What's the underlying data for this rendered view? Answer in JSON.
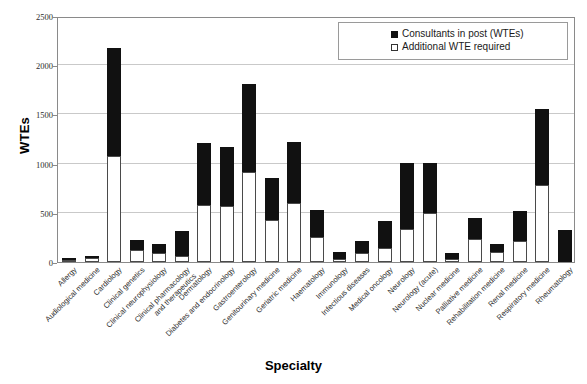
{
  "chart_data": {
    "type": "bar",
    "subtype": "stacked-bar",
    "title": "",
    "xlabel": "Specialty",
    "ylabel": "WTEs",
    "ylim": [
      0,
      2500
    ],
    "ytick_step": 500,
    "yticks": [
      0,
      500,
      1000,
      1500,
      2000,
      2500
    ],
    "ytick_labels": [
      "0",
      "500",
      "1000",
      "1500",
      "2000",
      "2500"
    ],
    "grid": true,
    "legend_position": "top-right",
    "categories": [
      "Allergy",
      "Audiological medicine",
      "Cardiology",
      "Clinical genetics",
      "Clinical neurophysiology",
      "Clinical pharmacology\nand therapeutics",
      "Dermatology",
      "Diabetes and endocrinology",
      "Gastroenterology",
      "Genitourinary medicine",
      "Geriatric medicine",
      "Haematology",
      "Immunology",
      "Infectious diseases",
      "Medical oncology",
      "Neurology",
      "Neurology (acute)",
      "Nuclear medicine",
      "Palliative medicine",
      "Rehabilitation medicine",
      "Renal medicine",
      "Respiratory medicine",
      "Rheumatology"
    ],
    "series": [
      {
        "name": "Additional WTE required",
        "fill": "#ffffff",
        "values": [
          18,
          45,
          1080,
          120,
          95,
          60,
          580,
          565,
          910,
          430,
          600,
          255,
          35,
          95,
          145,
          340,
          500,
          30,
          230,
          105,
          210,
          780,
          0
        ]
      },
      {
        "name": "Consultants in post (WTEs)",
        "fill": "#111111",
        "values": [
          10,
          20,
          1100,
          105,
          90,
          260,
          625,
          605,
          900,
          425,
          620,
          275,
          65,
          115,
          275,
          665,
          510,
          65,
          220,
          80,
          310,
          770,
          330
        ]
      }
    ],
    "totals": [
      28,
      65,
      2180,
      225,
      185,
      320,
      1205,
      1170,
      1810,
      855,
      1220,
      530,
      100,
      210,
      420,
      1005,
      1010,
      95,
      450,
      185,
      520,
      1550,
      330
    ]
  },
  "legend": {
    "entries": [
      {
        "label": "Consultants in post (WTEs)",
        "swatch": "filled"
      },
      {
        "label": "Additional WTE required",
        "swatch": "hollow"
      }
    ]
  },
  "axes": {
    "y_title": "WTEs",
    "x_title": "Specialty"
  }
}
